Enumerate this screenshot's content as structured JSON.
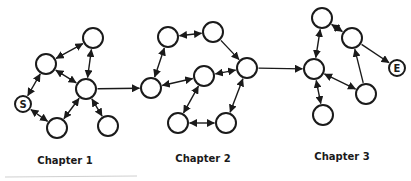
{
  "diagram": {
    "canvas": {
      "width": 411,
      "height": 181
    },
    "colors": {
      "background": "#ffffff",
      "stroke": "#1a1a1a",
      "node_fill": "#ffffff",
      "label_text": "#1a1a1a",
      "artifact_line": "#c9c9c9"
    },
    "style": {
      "node_stroke_width": 2,
      "edge_stroke_width": 1.4,
      "arrow_size": 8,
      "node_font_size": 10,
      "label_font_size": 10
    },
    "nodes": [
      {
        "id": "s",
        "name": "start-node",
        "x": 23,
        "y": 104,
        "r": 8,
        "label": "S"
      },
      {
        "id": "n1",
        "name": "ch1-upper-left-node",
        "x": 46,
        "y": 64,
        "r": 10,
        "label": ""
      },
      {
        "id": "n2",
        "name": "ch1-top-node",
        "x": 93,
        "y": 38,
        "r": 10,
        "label": ""
      },
      {
        "id": "n3",
        "name": "ch1-hub-node",
        "x": 86,
        "y": 89,
        "r": 10,
        "label": ""
      },
      {
        "id": "n4",
        "name": "ch1-bottom-node",
        "x": 57,
        "y": 128,
        "r": 10,
        "label": ""
      },
      {
        "id": "n5",
        "name": "ch1-bottom-right-node",
        "x": 108,
        "y": 126,
        "r": 10,
        "label": ""
      },
      {
        "id": "n6",
        "name": "ch2-left-node",
        "x": 151,
        "y": 88,
        "r": 10,
        "label": ""
      },
      {
        "id": "n7",
        "name": "ch2-top-left-node",
        "x": 168,
        "y": 37,
        "r": 10,
        "label": ""
      },
      {
        "id": "n8",
        "name": "ch2-top-right-node",
        "x": 213,
        "y": 32,
        "r": 10,
        "label": ""
      },
      {
        "id": "n9",
        "name": "ch2-center-node",
        "x": 204,
        "y": 76,
        "r": 10,
        "label": ""
      },
      {
        "id": "n10",
        "name": "ch2-right-node",
        "x": 247,
        "y": 68,
        "r": 10,
        "label": ""
      },
      {
        "id": "n11",
        "name": "ch2-bottom-left-node",
        "x": 178,
        "y": 123,
        "r": 10,
        "label": ""
      },
      {
        "id": "n12",
        "name": "ch2-bottom-right-node",
        "x": 226,
        "y": 123,
        "r": 10,
        "label": ""
      },
      {
        "id": "n13",
        "name": "ch3-hub-node",
        "x": 314,
        "y": 69,
        "r": 10,
        "label": ""
      },
      {
        "id": "n14",
        "name": "ch3-top-node",
        "x": 322,
        "y": 18,
        "r": 10,
        "label": ""
      },
      {
        "id": "n15",
        "name": "ch3-upper-right-node",
        "x": 352,
        "y": 38,
        "r": 10,
        "label": ""
      },
      {
        "id": "n16",
        "name": "ch3-lower-right-node",
        "x": 366,
        "y": 94,
        "r": 10,
        "label": ""
      },
      {
        "id": "n17",
        "name": "ch3-bottom-node",
        "x": 323,
        "y": 115,
        "r": 10,
        "label": ""
      },
      {
        "id": "e",
        "name": "end-node",
        "x": 397,
        "y": 68,
        "r": 8,
        "label": "E"
      }
    ],
    "edges": [
      {
        "from": "s",
        "to": "n1",
        "dir": "both"
      },
      {
        "from": "n1",
        "to": "n2",
        "dir": "both"
      },
      {
        "from": "n1",
        "to": "n3",
        "dir": "both"
      },
      {
        "from": "n2",
        "to": "n3",
        "dir": "both"
      },
      {
        "from": "s",
        "to": "n4",
        "dir": "both"
      },
      {
        "from": "n4",
        "to": "n3",
        "dir": "both"
      },
      {
        "from": "n3",
        "to": "n5",
        "dir": "both"
      },
      {
        "from": "n3",
        "to": "n6",
        "dir": "forward"
      },
      {
        "from": "n6",
        "to": "n7",
        "dir": "both"
      },
      {
        "from": "n7",
        "to": "n8",
        "dir": "both"
      },
      {
        "from": "n8",
        "to": "n10",
        "dir": "forward"
      },
      {
        "from": "n10",
        "to": "n9",
        "dir": "both"
      },
      {
        "from": "n9",
        "to": "n6",
        "dir": "both"
      },
      {
        "from": "n9",
        "to": "n11",
        "dir": "both"
      },
      {
        "from": "n11",
        "to": "n12",
        "dir": "both"
      },
      {
        "from": "n12",
        "to": "n10",
        "dir": "both"
      },
      {
        "from": "n10",
        "to": "n13",
        "dir": "forward"
      },
      {
        "from": "n13",
        "to": "n14",
        "dir": "both"
      },
      {
        "from": "n14",
        "to": "n15",
        "dir": "both"
      },
      {
        "from": "n15",
        "to": "e",
        "dir": "forward"
      },
      {
        "from": "n16",
        "to": "n15",
        "dir": "forward"
      },
      {
        "from": "n13",
        "to": "n16",
        "dir": "both"
      },
      {
        "from": "n13",
        "to": "n17",
        "dir": "both"
      }
    ],
    "chapters": [
      {
        "label": "Chapter 1",
        "x": 65,
        "y": 164
      },
      {
        "label": "Chapter 2",
        "x": 203,
        "y": 162
      },
      {
        "label": "Chapter 3",
        "x": 342,
        "y": 160
      }
    ],
    "artifact_line": {
      "x1": 5,
      "y1": 177,
      "x2": 137,
      "y2": 176
    }
  }
}
